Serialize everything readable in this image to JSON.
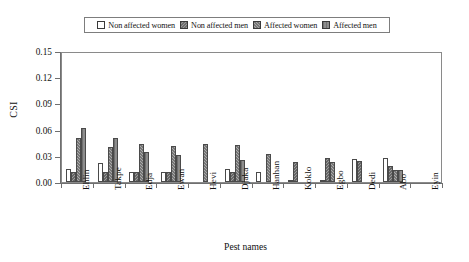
{
  "chart_data": {
    "type": "bar",
    "title": "",
    "xlabel": "Pest names",
    "ylabel": "CSI",
    "ylim": [
      0.0,
      0.15
    ],
    "yticks": [
      "0.00",
      "0.03",
      "0.06",
      "0.09",
      "0.12",
      "0.15"
    ],
    "ytick_values": [
      0.0,
      0.03,
      0.06,
      0.09,
      0.12,
      0.15
    ],
    "grid": false,
    "legend_position": "top-center",
    "categories": [
      "Ehlin",
      "Takpe",
      "Edja",
      "Ewan",
      "Hevi",
      "Djaka",
      "Hanhan",
      "Koklo",
      "Egbo",
      "Dedi",
      "Abo",
      "Eyin"
    ],
    "series": [
      {
        "name": "Non affected women",
        "fill": "white",
        "color": "#ffffff",
        "values": [
          0.015,
          0.022,
          0.011,
          0.011,
          0.0,
          0.015,
          0.012,
          0.002,
          0.002,
          0.026,
          0.028,
          0.0
        ]
      },
      {
        "name": "Non affected men",
        "fill": "hatched-gray",
        "color": "#9c9c9c",
        "values": [
          0.012,
          0.011,
          0.011,
          0.011,
          0.0,
          0.012,
          0.0,
          0.023,
          0.027,
          0.024,
          0.018,
          0.0
        ]
      },
      {
        "name": "Affected women",
        "fill": "light-gray",
        "color": "#ababab",
        "values": [
          0.05,
          0.04,
          0.044,
          0.041,
          0.044,
          0.042,
          0.032,
          0.0,
          0.023,
          0.0,
          0.014,
          0.0
        ]
      },
      {
        "name": "Affected men",
        "fill": "dark-gray",
        "color": "#8d8d8d",
        "values": [
          0.062,
          0.05,
          0.034,
          0.031,
          0.0,
          0.025,
          0.0,
          0.0,
          0.0,
          0.0,
          0.014,
          0.0
        ]
      }
    ]
  },
  "legend": {
    "items": [
      {
        "label": "Non affected women"
      },
      {
        "label": "Non affected men"
      },
      {
        "label": "Affected women"
      },
      {
        "label": "Affected men"
      }
    ]
  },
  "axes": {
    "y_title": "CSI",
    "x_title": "Pest names"
  }
}
